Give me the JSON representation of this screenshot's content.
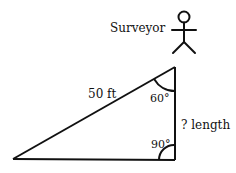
{
  "diagram": {
    "surveyor_label": "Surveyor",
    "hypotenuse_label": "50 ft",
    "top_angle_label": "60°",
    "bottom_angle_label": "90°",
    "vertical_side_label": "? length",
    "stroke_color": "#111111",
    "background": "#ffffff"
  }
}
